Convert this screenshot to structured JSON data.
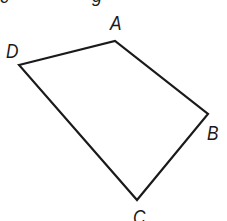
{
  "figure": {
    "type": "quadrilateral",
    "stroke_color": "#1a1a1a",
    "stroke_width": 2.2,
    "vertices": [
      {
        "name": "A",
        "x": 115,
        "y": 41,
        "label_x": 110,
        "label_y": 12
      },
      {
        "name": "B",
        "x": 208,
        "y": 114,
        "label_x": 207,
        "label_y": 122
      },
      {
        "name": "C",
        "x": 137,
        "y": 200,
        "label_x": 133,
        "label_y": 206
      },
      {
        "name": "D",
        "x": 19,
        "y": 65,
        "label_x": 6,
        "label_y": 40
      }
    ],
    "path_order": [
      "D",
      "A",
      "B",
      "C"
    ]
  },
  "labels": {
    "A": "A",
    "B": "B",
    "C": "C",
    "D": "D"
  },
  "cropped_top_text": {
    "left_fragment": "c",
    "mid_fragment": "g"
  }
}
